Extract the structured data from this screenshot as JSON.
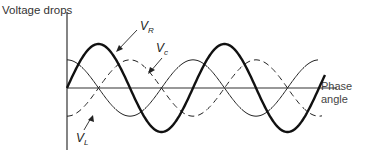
{
  "chart_data": {
    "type": "line",
    "title": "",
    "ylabel": "Voltage drops",
    "xlabel": "Phase angle",
    "grid": false,
    "legend": "inline labels with arrows",
    "series": [
      {
        "name": "V_R",
        "label": "V",
        "subscript": "R",
        "style": "thick solid",
        "phase_deg": 0,
        "amplitude": 1.0
      },
      {
        "name": "V_c",
        "label": "V",
        "subscript": "c",
        "style": "dashed",
        "phase_deg": -90,
        "amplitude": 0.64
      },
      {
        "name": "V_L",
        "label": "V",
        "subscript": "L",
        "style": "thin solid",
        "phase_deg": 90,
        "amplitude": 0.64
      }
    ],
    "x_range_cycles": 2.1,
    "ylim": [
      -1,
      1
    ]
  },
  "axes": {
    "y_label": "Voltage drops",
    "x_label_line1": "Phase",
    "x_label_line2": "angle"
  },
  "labels": {
    "vr_main": "V",
    "vr_sub": "R",
    "vc_main": "V",
    "vc_sub": "c",
    "vl_main": "V",
    "vl_sub": "L"
  },
  "colors": {
    "line": "#1a1a1a",
    "axis": "#333333"
  }
}
